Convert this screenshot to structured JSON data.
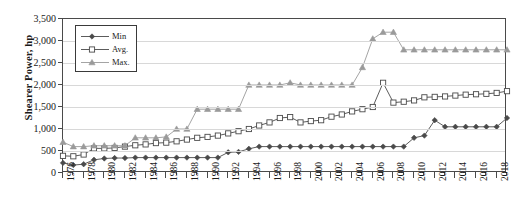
{
  "chart_data": {
    "type": "line",
    "title": "",
    "xlabel": "",
    "ylabel": "Shearer Power, hp",
    "ylim": [
      0,
      3500
    ],
    "ytick_step": 500,
    "ytick_labels": [
      "0",
      "500",
      "1,000",
      "1,500",
      "2,000",
      "2,500",
      "3,000",
      "3,500"
    ],
    "xlim": [
      1976,
      2019
    ],
    "xtick_labels": [
      "1976",
      "1978",
      "1980",
      "1982",
      "1984",
      "1986",
      "1988",
      "1990",
      "1992",
      "1994",
      "1996",
      "1998",
      "2000",
      "2002",
      "2004",
      "2006",
      "2008",
      "2010",
      "2012",
      "2014",
      "2016",
      "2018"
    ],
    "xtick_step": 2,
    "grid": true,
    "legend_position": "top-left",
    "x": [
      1976,
      1977,
      1978,
      1979,
      1980,
      1981,
      1982,
      1983,
      1984,
      1985,
      1986,
      1987,
      1988,
      1989,
      1990,
      1991,
      1992,
      1993,
      1994,
      1995,
      1996,
      1997,
      1998,
      1999,
      2000,
      2001,
      2002,
      2003,
      2004,
      2005,
      2006,
      2007,
      2008,
      2009,
      2010,
      2011,
      2012,
      2013,
      2014,
      2015,
      2016,
      2017,
      2018,
      2019
    ],
    "series": [
      {
        "name": "Min",
        "marker": "filled-diamond",
        "color": "#4a4a4a",
        "values": [
          230,
          180,
          200,
          300,
          330,
          340,
          340,
          350,
          350,
          350,
          350,
          350,
          350,
          350,
          350,
          350,
          470,
          480,
          550,
          600,
          600,
          600,
          600,
          600,
          600,
          600,
          600,
          600,
          600,
          600,
          600,
          600,
          600,
          600,
          800,
          850,
          1200,
          1050,
          1050,
          1050,
          1050,
          1050,
          1050,
          1250
        ]
      },
      {
        "name": "Avg.",
        "marker": "open-square",
        "color": "#4a4a4a",
        "values": [
          390,
          380,
          420,
          560,
          560,
          570,
          600,
          630,
          650,
          680,
          690,
          720,
          760,
          800,
          820,
          850,
          900,
          950,
          1000,
          1080,
          1150,
          1250,
          1270,
          1150,
          1180,
          1200,
          1280,
          1330,
          1400,
          1450,
          1500,
          2050,
          1600,
          1620,
          1650,
          1720,
          1730,
          1740,
          1760,
          1780,
          1790,
          1800,
          1820,
          1860
        ]
      },
      {
        "name": "Max.",
        "marker": "filled-triangle",
        "color": "#9a9a9a",
        "values": [
          700,
          600,
          600,
          620,
          620,
          620,
          620,
          800,
          800,
          800,
          820,
          1000,
          1000,
          1450,
          1450,
          1450,
          1450,
          1450,
          2000,
          2000,
          2000,
          2000,
          2050,
          2000,
          2000,
          2000,
          2000,
          2000,
          2000,
          2400,
          3050,
          3200,
          3200,
          2800,
          2800,
          2800,
          2800,
          2800,
          2800,
          2800,
          2800,
          2800,
          2800,
          2800
        ]
      }
    ]
  }
}
